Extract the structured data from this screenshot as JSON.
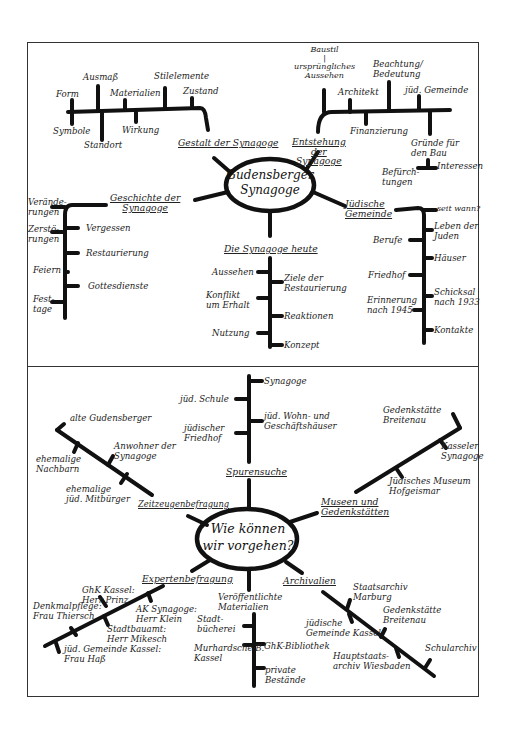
{
  "upper_map": {
    "center": "Gudensberger\nSynagoge",
    "branches": {
      "gestalt": {
        "title": "Gestalt der Synagoge",
        "items": [
          "Form",
          "Ausmaß",
          "Materialien",
          "Stilelemente",
          "Zustand",
          "Symbole",
          "Standort",
          "Wirkung"
        ]
      },
      "entstehung": {
        "title": "Entstehung\nder\nSynagoge",
        "items": [
          "Baustil\n|\nursprüngliches\nAussehen",
          "Architekt",
          "Beachtung/\nBedeutung",
          "jüd. Gemeinde",
          "Finanzierung",
          "Gründe für\nden Bau",
          "Befürch-\ntungen",
          "Interessen"
        ]
      },
      "geschichte": {
        "title": "Geschichte der\nSynagoge",
        "items": [
          "Verände-\nrungen",
          "Zerstö-\nrungen",
          "Feiern",
          "Fest-\ntage",
          "Vergessen",
          "Restaurierung",
          "Gottesdienste"
        ]
      },
      "heute": {
        "title": "Die Synagoge heute",
        "items": [
          "Aussehen",
          "Konflikt\num Erhalt",
          "Nutzung",
          "Ziele der\nRestaurierung",
          "Reaktionen",
          "Konzept"
        ]
      },
      "gemeinde": {
        "title": "Jüdische\nGemeinde",
        "items": [
          "seit wann?",
          "Leben der\nJuden",
          "Berufe",
          "Häuser",
          "Friedhof",
          "Schicksal\nnach 1933",
          "Erinnerung\nnach 1945",
          "Kontakte"
        ]
      }
    }
  },
  "lower_map": {
    "center": "Wie können\nwir vorgehen?",
    "branches": {
      "spurensuche": {
        "title": "Spurensuche",
        "items": [
          "Synagoge",
          "jüd. Schule",
          "jüd. Wohn- und\nGeschäftshäuser",
          "jüdischer\nFriedhof"
        ]
      },
      "zeitzeugen": {
        "title": "Zeitzeugenbefragung",
        "items": [
          "alte Gudensberger",
          "ehemalige\nNachbarn",
          "Anwohner der\nSynagoge",
          "ehemalige\njüd. Mitbürger"
        ]
      },
      "museen": {
        "title": "Museen und\nGedenkstätten",
        "items": [
          "Gedenkstätte\nBreitenau",
          "Kasseler\nSynagoge",
          "Jüdisches Museum\nHofgeismar"
        ]
      },
      "experten": {
        "title": "Expertenbefragung",
        "items": [
          "GhK Kassel:\nHerr Prinz",
          "Denkmalpflege:\nFrau Thiersch",
          "AK Synagoge:\nHerr Klein",
          "Stadtbauamt:\nHerr Mikesch",
          "jüd. Gemeinde Kassel:\nFrau Haß"
        ]
      },
      "materialien": {
        "title": "Veröffentlichte\nMaterialien",
        "items": [
          "Stadt-\nbücherei",
          "Murhardsche B.\nKassel",
          "GhK-Bibliothek",
          "private\nBestände"
        ]
      },
      "archivalien": {
        "title": "Archivalien",
        "items": [
          "Staatsarchiv\nMarburg",
          "jüdische\nGemeinde Kassel",
          "Gedenkstätte\nBreitenau",
          "Hauptstaats-\narchiv Wiesbaden",
          "Schularchiv"
        ]
      }
    }
  },
  "colors": {
    "ink": "#1a1a1a",
    "paper": "#ffffff",
    "frame": "#333333"
  }
}
